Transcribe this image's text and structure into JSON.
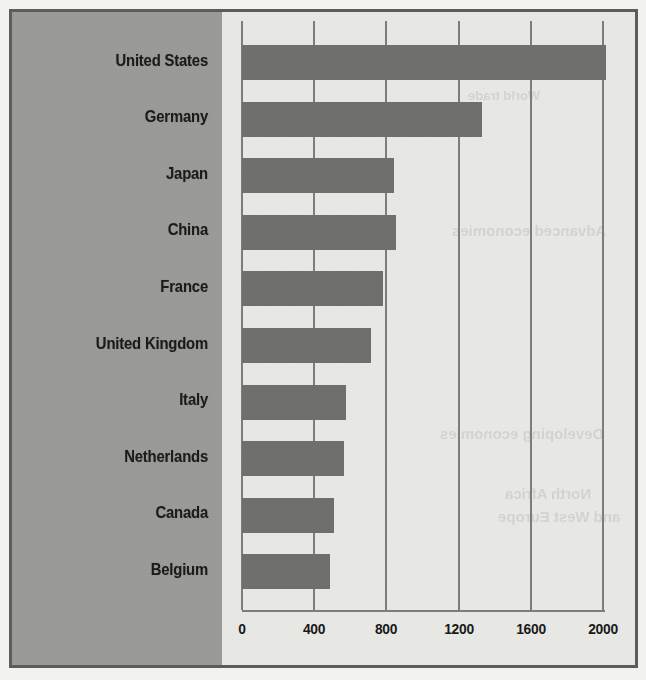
{
  "figure": {
    "panel_background_color": "#9e9e9a",
    "plot_background_color": "#e9e9e5",
    "frame_color": "#5d5d5a",
    "bar_color": "#6f6f6d",
    "gridline_color": "#7e7e7c",
    "label_color": "#1c1c1c"
  },
  "chart_data": {
    "type": "bar",
    "orientation": "horizontal",
    "title": "",
    "subtitle": "",
    "xlabel": "",
    "ylabel": "",
    "categories": [
      "United States",
      "Germany",
      "Japan",
      "China",
      "France",
      "United Kingdom",
      "Italy",
      "Netherlands",
      "Canada",
      "Belgium"
    ],
    "values": [
      2015,
      1330,
      842,
      853,
      781,
      715,
      577,
      565,
      510,
      488
    ],
    "series": [
      {
        "name": "",
        "values": [
          2015,
          1330,
          842,
          853,
          781,
          715,
          577,
          565,
          510,
          488
        ]
      }
    ],
    "xlim": [
      0,
      2000
    ],
    "xticks": [
      0,
      400,
      800,
      1200,
      1600,
      2000
    ],
    "xtick_labels": [
      "0",
      "400",
      "800",
      "1200",
      "1600",
      "2000"
    ],
    "grid": "vertical",
    "legend": null,
    "legend_position": "none",
    "annotations": []
  },
  "show_through": {
    "note": "faint mirrored text bleeding through from the reverse side of the printed page",
    "fragments": [
      "Advanced economies",
      "Developing economies",
      "World trade",
      "North Africa",
      "and West Europe"
    ]
  }
}
